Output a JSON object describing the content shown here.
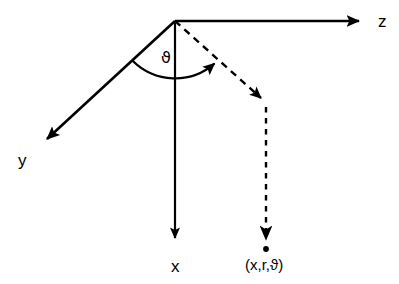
{
  "diagram": {
    "background_color": "#ffffff",
    "stroke_color": "#000000",
    "origin": {
      "x": 175,
      "y": 21
    },
    "axes": [
      {
        "name": "z",
        "label": "z",
        "style": "solid",
        "from": {
          "x": 175,
          "y": 21
        },
        "to": {
          "x": 368,
          "y": 21
        },
        "label_pos": {
          "x": 378,
          "y": 27
        },
        "direction": "right"
      },
      {
        "name": "y",
        "label": "y",
        "style": "solid",
        "from": {
          "x": 175,
          "y": 21
        },
        "to": {
          "x": 38,
          "y": 148
        },
        "label_pos": {
          "x": 18,
          "y": 166
        },
        "direction": "down-left"
      },
      {
        "name": "x",
        "label": "x",
        "style": "solid",
        "from": {
          "x": 175,
          "y": 21
        },
        "to": {
          "x": 175,
          "y": 249
        },
        "label_pos": {
          "x": 171,
          "y": 272
        },
        "direction": "down"
      }
    ],
    "angle": {
      "name": "theta",
      "label": "ϑ",
      "label_pos": {
        "x": 161,
        "y": 63
      },
      "arc_radius": 60,
      "arc_from": {
        "x": 128,
        "y": 57
      },
      "arc_to": {
        "x": 216,
        "y": 64
      },
      "arrow_at_end": true
    },
    "projection_ray": {
      "name": "radial-ray",
      "style": "dashed",
      "from": {
        "x": 175,
        "y": 21
      },
      "to": {
        "x": 268,
        "y": 105
      },
      "arrow_at_end": true
    },
    "drop_line": {
      "name": "vertical-drop",
      "style": "dashed",
      "from": {
        "x": 266,
        "y": 107
      },
      "to": {
        "x": 266,
        "y": 247
      },
      "arrow_at_end": true,
      "dot_at_end": true
    },
    "point": {
      "name": "coordinate-point",
      "label": "(x,r,ϑ)",
      "label_pos": {
        "x": 245,
        "y": 270
      },
      "marker_pos": {
        "x": 266,
        "y": 249
      }
    }
  }
}
